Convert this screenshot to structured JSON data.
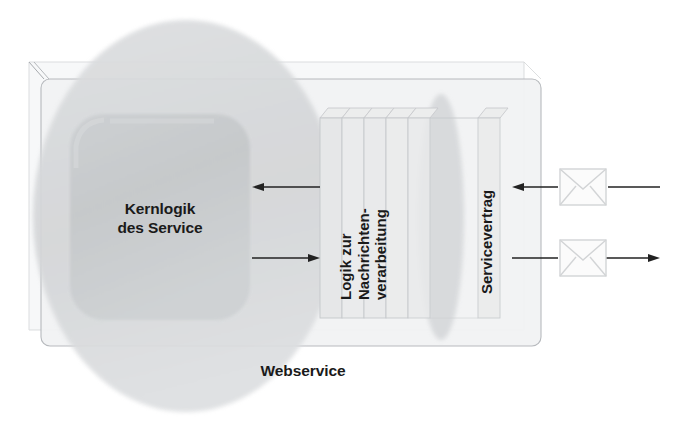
{
  "diagram": {
    "title": "Webservice",
    "language": "de",
    "type": "architecture-layer-diagram",
    "background_color": "#ffffff"
  },
  "labels": {
    "core_logic": "Kernlogik\ndes Service",
    "core_logic_line1": "Kernlogik",
    "core_logic_line2": "des Service",
    "message_logic": "Logik zur\nNachrichten-\nverarbeitung",
    "message_logic_line1": "Logik zur",
    "message_logic_line2": "Nachrichten-",
    "message_logic_line3": "verarbeitung",
    "service_contract": "Servicevertrag",
    "webservice": "Webservice"
  },
  "shapes": {
    "outer_container": {
      "name": "webservice-boundary-box",
      "x": 35,
      "y": 72,
      "width": 506,
      "height": 274,
      "stroke": "#b9bcc0",
      "fill": "#f3f4f5"
    },
    "core_logic_box": {
      "name": "core-logic-rounded-box",
      "x": 70,
      "y": 114,
      "width": 180,
      "height": 206,
      "fill": "#c9ccce",
      "radius": 34
    },
    "service_ellipse": {
      "name": "webservice-ellipse",
      "cx": 186,
      "cy": 216,
      "rx": 153,
      "ry": 196,
      "fill": "#d7d9db"
    },
    "contract_ellipse": {
      "name": "service-contract-ellipse",
      "cx": 441,
      "cy": 217,
      "rx": 22,
      "ry": 122,
      "fill": "#d9dbdd"
    }
  },
  "panels": {
    "name": "message-processing-layers",
    "count": 6,
    "x_positions": [
      320,
      342,
      364,
      386,
      408,
      478
    ],
    "top": 118,
    "bottom": 318,
    "width": 22,
    "fill": "#e8e9ea",
    "stroke": "#c4c7ca"
  },
  "arrows": [
    {
      "name": "inbound-internal-arrow",
      "direction": "left",
      "from_x": 320,
      "to_x": 252,
      "y": 187,
      "color": "#222222"
    },
    {
      "name": "outbound-internal-arrow",
      "direction": "right",
      "from_x": 252,
      "to_x": 320,
      "y": 258,
      "color": "#222222"
    },
    {
      "name": "inbound-external-arrow",
      "direction": "left",
      "from_x": 660,
      "to_x": 512,
      "y": 187,
      "color": "#222222"
    },
    {
      "name": "outbound-external-arrow",
      "direction": "right",
      "from_x": 512,
      "to_x": 660,
      "y": 258,
      "color": "#222222"
    }
  ],
  "envelopes": [
    {
      "name": "inbound-message-envelope",
      "x": 560,
      "y": 168,
      "width": 46,
      "height": 36,
      "stroke": "#d0d2d4"
    },
    {
      "name": "outbound-message-envelope",
      "x": 560,
      "y": 239,
      "width": 46,
      "height": 36,
      "stroke": "#d0d2d4"
    }
  ],
  "colors": {
    "ink": "#1a1a1a",
    "line": "#222222",
    "panel_fill": "#e8e9ea",
    "panel_stroke": "#c4c7ca",
    "ellipse_outer": "#d7d9db",
    "core_box": "#c9ccce",
    "container_fill": "#f3f4f5",
    "container_stroke": "#b9bcc0"
  }
}
